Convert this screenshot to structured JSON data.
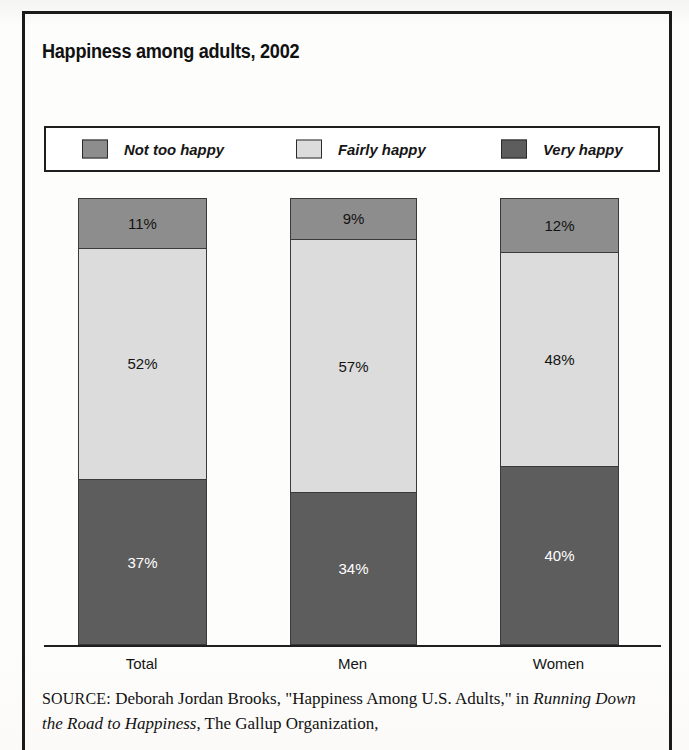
{
  "figure": {
    "title": "Happiness among adults, 2002"
  },
  "legend": {
    "items": [
      {
        "label": "Not too happy",
        "color": "#8d8d8d",
        "swatch_name": "legend-swatch-not-too-happy"
      },
      {
        "label": "Fairly happy",
        "color": "#dcdcdc",
        "swatch_name": "legend-swatch-fairly-happy"
      },
      {
        "label": "Very happy",
        "color": "#5d5d5d",
        "swatch_name": "legend-swatch-very-happy"
      }
    ]
  },
  "source": {
    "kicker": "SOURCE:",
    "line1": " Deborah Jordan Brooks, \"Happiness Among U.S. Adults,\" in ",
    "title_italic": "Running Down the Road to Happiness",
    "line2": ", The Gallup Organization,"
  },
  "chart_data": {
    "type": "bar",
    "subtype": "100-percent-stacked-column",
    "title": "Happiness among adults, 2002",
    "xlabel": "",
    "ylabel": "",
    "ylim": [
      0,
      100
    ],
    "grid": false,
    "legend_position": "top",
    "categories": [
      "Total",
      "Men",
      "Women"
    ],
    "stack_order_top_to_bottom": [
      "Not too happy",
      "Fairly happy",
      "Very happy"
    ],
    "series": [
      {
        "name": "Not too happy",
        "color": "#8d8d8d",
        "values": [
          11,
          9,
          12
        ],
        "labels": [
          "11%",
          "9%",
          "12%"
        ]
      },
      {
        "name": "Fairly happy",
        "color": "#dcdcdc",
        "values": [
          52,
          57,
          48
        ],
        "labels": [
          "52%",
          "57%",
          "48%"
        ]
      },
      {
        "name": "Very happy",
        "color": "#5d5d5d",
        "values": [
          37,
          34,
          40
        ],
        "labels": [
          "37%",
          "34%",
          "40%"
        ]
      }
    ],
    "bars": [
      {
        "category": "Total",
        "segments": [
          {
            "series": "Not too happy",
            "value": 11,
            "label": "11%"
          },
          {
            "series": "Fairly happy",
            "value": 52,
            "label": "52%"
          },
          {
            "series": "Very happy",
            "value": 37,
            "label": "37%"
          }
        ]
      },
      {
        "category": "Men",
        "segments": [
          {
            "series": "Not too happy",
            "value": 9,
            "label": "9%"
          },
          {
            "series": "Fairly happy",
            "value": 57,
            "label": "57%"
          },
          {
            "series": "Very happy",
            "value": 34,
            "label": "34%"
          }
        ]
      },
      {
        "category": "Women",
        "segments": [
          {
            "series": "Not too happy",
            "value": 12,
            "label": "12%"
          },
          {
            "series": "Fairly happy",
            "value": 48,
            "label": "48%"
          },
          {
            "series": "Very happy",
            "value": 40,
            "label": "40%"
          }
        ]
      }
    ]
  }
}
